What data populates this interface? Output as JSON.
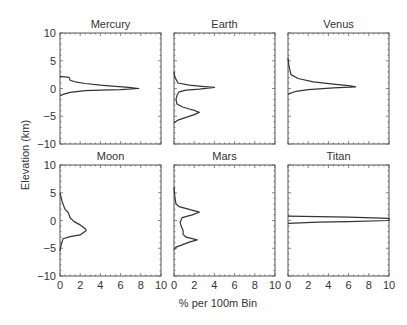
{
  "figure": {
    "ylabel": "Elevation (km)",
    "xlabel": "% per 100m Bin"
  },
  "chart_data": {
    "type": "line",
    "layout": "2x3 small multiples, shared axes",
    "xlabel": "% per 100m Bin",
    "ylabel": "Elevation (km)",
    "xlim": [
      0,
      10
    ],
    "ylim": [
      -10,
      10
    ],
    "xticks": [
      0,
      2,
      4,
      6,
      8,
      10
    ],
    "yticks": [
      -10,
      -5,
      0,
      5,
      10
    ],
    "grid": false,
    "panels": [
      {
        "title": "Mercury",
        "row": 0,
        "col": 0,
        "points": [
          [
            0,
            2.2
          ],
          [
            0.9,
            2.0
          ],
          [
            1.0,
            1.5
          ],
          [
            1.5,
            1.2
          ],
          [
            2.5,
            0.9
          ],
          [
            4.0,
            0.6
          ],
          [
            5.5,
            0.4
          ],
          [
            6.8,
            0.2
          ],
          [
            7.8,
            0.0
          ],
          [
            6.0,
            -0.2
          ],
          [
            4.0,
            -0.3
          ],
          [
            2.5,
            -0.4
          ],
          [
            1.0,
            -0.7
          ],
          [
            0.4,
            -1.0
          ],
          [
            0,
            -1.3
          ]
        ]
      },
      {
        "title": "Earth",
        "row": 0,
        "col": 1,
        "points": [
          [
            0,
            3.0
          ],
          [
            0.1,
            2.0
          ],
          [
            0.4,
            1.0
          ],
          [
            1.5,
            0.6
          ],
          [
            3.0,
            0.35
          ],
          [
            4.0,
            0.2
          ],
          [
            2.5,
            -0.1
          ],
          [
            1.2,
            -0.3
          ],
          [
            0.5,
            -0.6
          ],
          [
            0.3,
            -1.2
          ],
          [
            0.2,
            -2.0
          ],
          [
            0.3,
            -2.8
          ],
          [
            0.8,
            -3.3
          ],
          [
            1.5,
            -3.7
          ],
          [
            2.1,
            -4.0
          ],
          [
            2.5,
            -4.3
          ],
          [
            2.0,
            -4.7
          ],
          [
            1.2,
            -5.2
          ],
          [
            0.4,
            -5.7
          ],
          [
            0,
            -6.2
          ]
        ]
      },
      {
        "title": "Venus",
        "row": 0,
        "col": 2,
        "points": [
          [
            0,
            5.5
          ],
          [
            0.1,
            4.0
          ],
          [
            0.3,
            2.5
          ],
          [
            1.0,
            1.8
          ],
          [
            2.5,
            1.2
          ],
          [
            4.5,
            0.8
          ],
          [
            6.0,
            0.5
          ],
          [
            6.7,
            0.3
          ],
          [
            4.5,
            0.1
          ],
          [
            2.0,
            -0.2
          ],
          [
            0.8,
            -0.5
          ],
          [
            0,
            -1.0
          ]
        ]
      },
      {
        "title": "Moon",
        "row": 1,
        "col": 0,
        "points": [
          [
            0,
            5.0
          ],
          [
            0.2,
            3.5
          ],
          [
            0.5,
            2.0
          ],
          [
            0.8,
            1.5
          ],
          [
            1.0,
            0.5
          ],
          [
            1.4,
            -0.2
          ],
          [
            2.0,
            -0.8
          ],
          [
            2.5,
            -1.5
          ],
          [
            2.6,
            -1.8
          ],
          [
            2.3,
            -2.2
          ],
          [
            2.0,
            -2.6
          ],
          [
            1.0,
            -2.9
          ],
          [
            0.3,
            -3.3
          ],
          [
            0.1,
            -4.5
          ],
          [
            0,
            -5.5
          ]
        ]
      },
      {
        "title": "Mars",
        "row": 1,
        "col": 1,
        "points": [
          [
            0,
            6.0
          ],
          [
            0.1,
            4.0
          ],
          [
            0.2,
            3.0
          ],
          [
            0.5,
            2.5
          ],
          [
            1.5,
            2.0
          ],
          [
            2.5,
            1.5
          ],
          [
            1.8,
            1.0
          ],
          [
            0.8,
            0.5
          ],
          [
            0.6,
            -0.3
          ],
          [
            0.7,
            -1.0
          ],
          [
            0.9,
            -1.8
          ],
          [
            0.9,
            -2.5
          ],
          [
            1.2,
            -3.0
          ],
          [
            2.3,
            -3.5
          ],
          [
            1.5,
            -3.9
          ],
          [
            0.8,
            -4.4
          ],
          [
            0.2,
            -4.8
          ],
          [
            0,
            -5.3
          ]
        ]
      },
      {
        "title": "Titan",
        "row": 1,
        "col": 2,
        "points": [
          [
            0,
            0.8
          ],
          [
            3,
            0.7
          ],
          [
            6,
            0.6
          ],
          [
            10,
            0.4
          ],
          [
            10,
            0.0
          ],
          [
            6,
            -0.2
          ],
          [
            3,
            -0.3
          ],
          [
            0,
            -0.5
          ]
        ],
        "note": "peak exceeds x-axis range (clipped at 10)"
      }
    ]
  },
  "style": {
    "line_color": "#333333",
    "axis_color": "#555555",
    "background": "#ffffff"
  }
}
